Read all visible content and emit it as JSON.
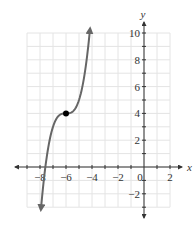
{
  "chart_data": {
    "type": "line",
    "title": "",
    "xlabel": "x",
    "ylabel": "y",
    "xlim": [
      -9,
      2
    ],
    "ylim": [
      -3,
      10
    ],
    "grid": true,
    "x_ticks": [
      -8,
      -6,
      -4,
      -2,
      0,
      2
    ],
    "y_ticks": [
      -2,
      2,
      4,
      6,
      8,
      10
    ],
    "x_tick_labels": [
      "−8",
      "−6",
      "−4",
      "−2",
      "0",
      "2"
    ],
    "y_tick_labels": [
      "−2",
      "2",
      "4",
      "6",
      "8",
      "10"
    ],
    "series": [
      {
        "name": "f(x) = (x+6)^3 + 4",
        "color": "#666666",
        "x": [
          -7.9,
          -7.6,
          -7.2,
          -7.0,
          -6.6,
          -6.3,
          -6.0,
          -5.7,
          -5.4,
          -5.0,
          -4.6,
          -4.2
        ],
        "y": [
          -2.86,
          -0.1,
          2.27,
          3.0,
          3.78,
          3.97,
          4.0,
          4.03,
          4.22,
          5.0,
          6.74,
          9.83
        ],
        "arrows": "both ends"
      }
    ],
    "points": [
      {
        "x": -6,
        "y": 4,
        "label": "inflection point",
        "color": "#000000"
      }
    ],
    "legend": null
  }
}
